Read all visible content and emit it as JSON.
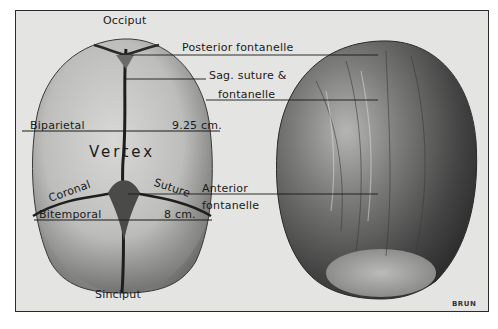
{
  "figure": {
    "type": "anatomical illustration",
    "credit": "BRUN"
  },
  "labels": {
    "occiput": "Occiput",
    "sinciput": "Sinciput",
    "vertex": "Vertex",
    "biparietal": "Biparietal",
    "biparietal_measure": "9.25 cm.",
    "bitemporal": "Bitemporal",
    "bitemporal_measure": "8 cm.",
    "coronal": "Coronal",
    "suture": "Suture",
    "posterior_fontanelle": "Posterior fontanelle",
    "sag_suture_line1": "Sag. suture &",
    "sag_suture_line2": "fontanelle",
    "anterior_line1": "Anterior",
    "anterior_line2": "fontanelle"
  },
  "colors": {
    "paper": "#e4e4e2",
    "ink": "#1a1a1a",
    "skull_light": "#c9c9c7",
    "skull_dark": "#555555",
    "hair_dark": "#2e2e2e",
    "hair_mid": "#6a6a6a"
  }
}
